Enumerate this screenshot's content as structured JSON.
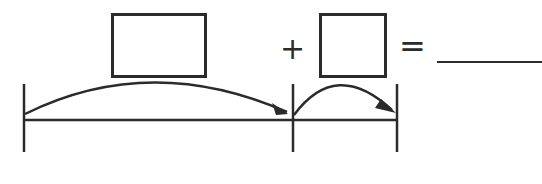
{
  "equation": {
    "box1": {
      "value": "",
      "role": "first-addend"
    },
    "operator": "+",
    "box2": {
      "value": "",
      "role": "second-addend"
    },
    "equals": "=",
    "answer": ""
  },
  "number_line": {
    "ticks": 3,
    "jumps": [
      {
        "from_tick": 0,
        "to_tick": 1,
        "label": ""
      },
      {
        "from_tick": 1,
        "to_tick": 2,
        "label": ""
      }
    ]
  },
  "colors": {
    "ink": "#2b2b2b",
    "background": "#ffffff"
  }
}
